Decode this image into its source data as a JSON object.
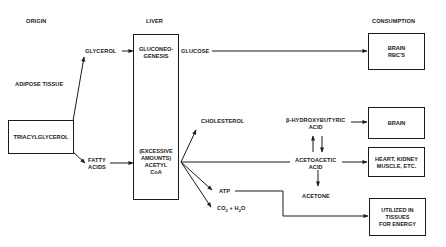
{
  "headers": {
    "origin": "ORIGIN",
    "liver": "LIVER",
    "consumption": "CONSUMPTION"
  },
  "origin": {
    "adipose_label": "ADIPOSE TISSUE",
    "triacylglycerol": "TRIACYLGLYCEROL",
    "glycerol": "GLYCEROL",
    "fatty_acids": "FATTY\nACIDS"
  },
  "liver": {
    "gluconeogenesis": "GLUCONEO-\nGENESIS",
    "acetyl_coa": "(EXCESSIVE\nAMOUNTS)\nACETYL\nCoA"
  },
  "products": {
    "glucose": "GLUCOSE",
    "cholesterol": "CHOLESTEROL",
    "beta_hydroxybutyric": "β-HYDROXYBUTYRIC\nACID",
    "acetoacetic": "ACETOACETIC\nACID",
    "acetone": "ACETONE",
    "atp": "ATP",
    "co2_h2o_parts": {
      "co": "CO",
      "sub2": "2",
      "plus_h": " + H",
      "sub2b": "2",
      "o": "O"
    }
  },
  "consumption": {
    "brain_rbc": "BRAIN\nRBC'S",
    "brain": "BRAIN",
    "heart_kidney": "HEART, KIDNEY\nMUSCLE, ETC.",
    "utilized": "UTILIZED IN\nTISSUES\nFOR ENERGY"
  }
}
